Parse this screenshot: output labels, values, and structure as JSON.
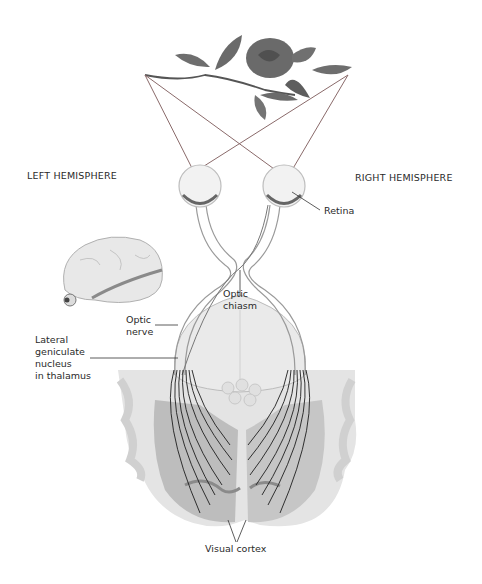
{
  "labels": {
    "left_hemisphere": "LEFT HEMISPHERE",
    "right_hemisphere": "RIGHT HEMISPHERE",
    "retina": "Retina",
    "optic_chiasm": "Optic\nchiasm",
    "optic_nerve": "Optic\nnerve",
    "lateral_geniculate": "Lateral\ngeniculate\nnucleus\nin thalamus",
    "visual_cortex": "Visual cortex"
  },
  "icons": {
    "rose": "rose-icon",
    "brain": "brain-side-view-icon",
    "eye_left": "eye-icon",
    "eye_right": "eye-icon"
  },
  "colors": {
    "background": "#ffffff",
    "line_dark": "#2a2a2a",
    "ray_color": "#8a6a6a",
    "cortex_gray": "#c8c8c8",
    "cortex_dark": "#a8a8a8",
    "nerve_fill": "#eeeeee"
  }
}
